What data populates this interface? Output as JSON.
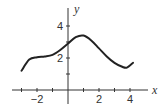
{
  "chart_data": {
    "type": "line",
    "title": "",
    "xlabel": "x",
    "ylabel": "y",
    "xlim": [
      -3.2,
      5
    ],
    "ylim": [
      -0.6,
      5
    ],
    "grid": false,
    "x_ticks": [
      -3,
      -2,
      -1,
      1,
      2,
      3,
      4
    ],
    "x_tick_labels": [
      "-2",
      "2",
      "4"
    ],
    "x_tick_label_values": [
      -2,
      2,
      4
    ],
    "y_ticks": [
      1,
      2,
      3,
      4
    ],
    "y_tick_labels": [
      "2",
      "4"
    ],
    "y_tick_label_values": [
      2,
      4
    ],
    "series": [
      {
        "name": "f(x)",
        "x": [
          -3,
          -2.5,
          -2,
          -1.5,
          -1,
          -0.5,
          0,
          0.5,
          1,
          1.5,
          2,
          2.5,
          3,
          3.5,
          3.8,
          4.2
        ],
        "y": [
          1.2,
          1.9,
          2.05,
          2.1,
          2.2,
          2.5,
          2.9,
          3.3,
          3.4,
          3.1,
          2.6,
          2.1,
          1.7,
          1.45,
          1.4,
          1.7
        ]
      }
    ]
  },
  "style": {
    "line_color": "#222222",
    "axis_color": "#333333"
  }
}
